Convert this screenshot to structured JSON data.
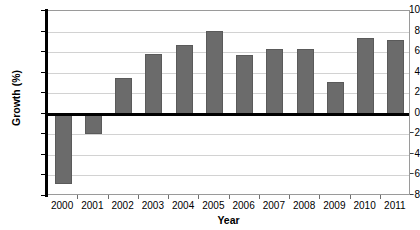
{
  "chart_data": {
    "type": "bar",
    "title": "",
    "xlabel": "Year",
    "ylabel": "Growth (%)",
    "categories": [
      "2000",
      "2001",
      "2002",
      "2003",
      "2004",
      "2005",
      "2006",
      "2007",
      "2008",
      "2009",
      "2010",
      "2011"
    ],
    "values": [
      -6.8,
      -2.0,
      3.5,
      5.8,
      6.7,
      8.1,
      5.7,
      6.3,
      6.3,
      3.1,
      7.4,
      7.2
    ],
    "series": [
      {
        "name": "Growth (%)",
        "values": [
          -6.8,
          -2.0,
          3.5,
          5.8,
          6.7,
          8.1,
          5.7,
          6.3,
          6.3,
          3.1,
          7.4,
          7.2
        ]
      }
    ],
    "ylim": [
      -8,
      10
    ],
    "ytick_step": 2,
    "yticks": [
      10,
      8,
      6,
      4,
      2,
      0,
      -2,
      -4,
      -6,
      -8
    ],
    "ytick_labels": [
      "10",
      "8",
      "6",
      "4",
      "2",
      "0",
      "-2",
      "-4",
      "-6",
      "-8"
    ],
    "grid": true,
    "grid_axis": "y",
    "legend": false,
    "legend_position": "none",
    "bar_color": "#6b6b6b",
    "bar_edge_color": "#5a5a5a",
    "gridline_color": "#d2d2d2",
    "axis_color": "#000000",
    "plot_border_color": "#9a9a9a",
    "background_color": "#ffffff",
    "zero_line_emphasis": true
  }
}
